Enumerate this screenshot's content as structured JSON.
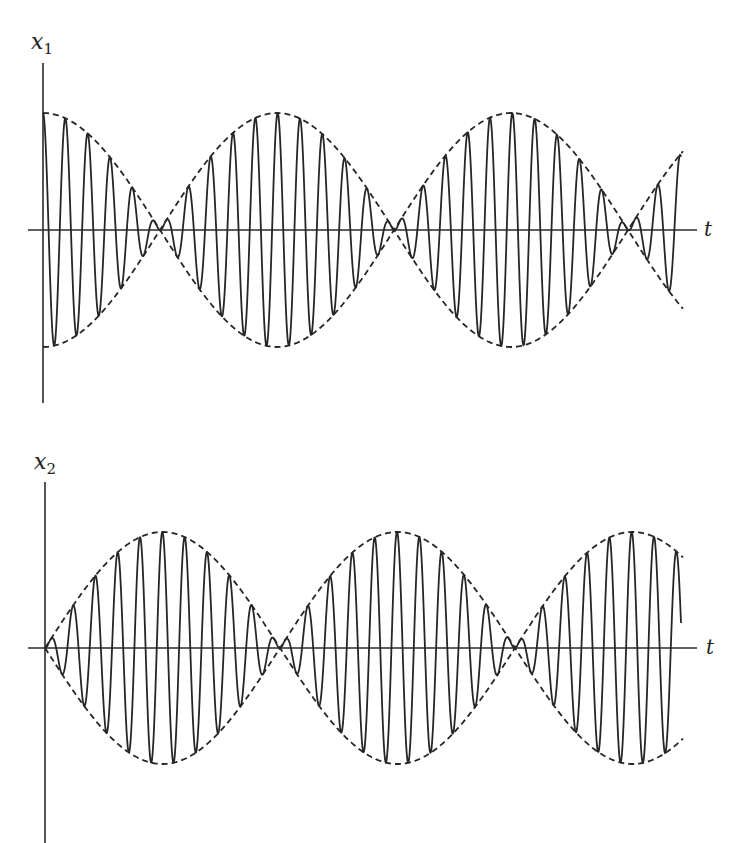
{
  "figure": {
    "plots": [
      {
        "id": "x1",
        "y_label": "x",
        "y_label_subscript": "1",
        "x_label": "t",
        "envelope": "cos",
        "origin": {
          "x": 43,
          "y": 230
        },
        "y_axis": {
          "x": 43,
          "y_top": 63,
          "y_bottom": 403
        },
        "x_axis": {
          "y": 230,
          "x_start": 28,
          "x_end": 697
        },
        "t_label_pos": {
          "x": 704,
          "y": 236
        },
        "y_label_pos": {
          "x": 31,
          "y": 49
        },
        "amplitude_px": 117,
        "envelope_half_period_px": 234,
        "carrier_period_px": 22.35,
        "signal_end_x": 681,
        "envelope_end_x": 683
      },
      {
        "id": "x2",
        "y_label": "x",
        "y_label_subscript": "2",
        "x_label": "t",
        "envelope": "sin",
        "origin": {
          "x": 45,
          "y": 648
        },
        "y_axis": {
          "x": 45,
          "y_top": 482,
          "y_bottom": 843
        },
        "x_axis": {
          "y": 648,
          "x_start": 28,
          "x_end": 697
        },
        "t_label_pos": {
          "x": 706,
          "y": 654
        },
        "y_label_pos": {
          "x": 34,
          "y": 469
        },
        "amplitude_px": 116,
        "envelope_half_period_px": 235,
        "carrier_period_px": 22.35,
        "signal_end_x": 681,
        "envelope_end_x": 683
      }
    ]
  },
  "colors": {
    "ink": "#262626",
    "background": "#ffffff"
  }
}
